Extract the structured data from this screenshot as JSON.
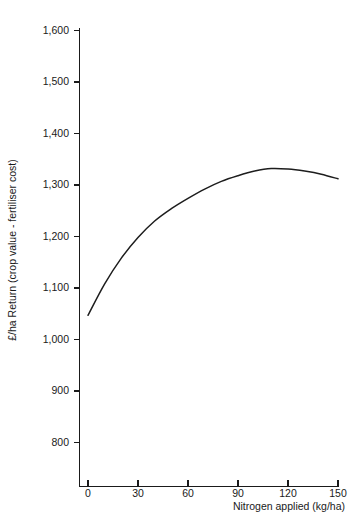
{
  "chart_data": {
    "type": "line",
    "title": "",
    "subtitle": "",
    "xlabel": "Nitrogen applied (kg/ha)",
    "ylabel": "£/ha  Return  (crop value - fertiliser cost)",
    "xlim": [
      -8,
      150
    ],
    "ylim": [
      745,
      1600
    ],
    "xticks": [
      0,
      30,
      60,
      90,
      120,
      150
    ],
    "xtick_labels": [
      "0",
      "30",
      "60",
      "90",
      "120",
      "150"
    ],
    "yticks": [
      800,
      900,
      1000,
      1100,
      1200,
      1300,
      1400,
      1500,
      1600
    ],
    "ytick_labels": [
      "800",
      "900",
      "1,000",
      "1,100",
      "1,200",
      "1,300",
      "1,400",
      "1,500",
      "1,600"
    ],
    "grid": false,
    "legend": null,
    "series": [
      {
        "name": "Return",
        "color": "#1d1d1d",
        "x": [
          0,
          10,
          20,
          30,
          40,
          50,
          60,
          70,
          80,
          90,
          100,
          110,
          120,
          130,
          140,
          150
        ],
        "values": [
          1047,
          1108,
          1158,
          1198,
          1230,
          1254,
          1274,
          1292,
          1307,
          1318,
          1327,
          1332,
          1331,
          1327,
          1321,
          1312
        ]
      }
    ],
    "annotations": []
  },
  "figure": {
    "background_color": "#ffffff",
    "axis_color": "#1a1a1a",
    "curve_color": "#1d1d1d"
  }
}
